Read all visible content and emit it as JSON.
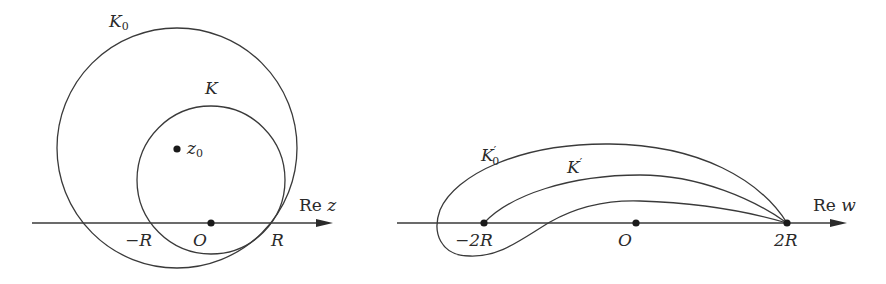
{
  "figure": {
    "left_panel": {
      "name": "z-plane",
      "axis_label": {
        "prefix": "Re",
        "var": "z"
      },
      "curves": [
        {
          "id": "K0",
          "label": "K",
          "subscript": "0",
          "type": "circle",
          "cx": 177,
          "cy": 148,
          "r": 120
        },
        {
          "id": "K",
          "label": "K",
          "subscript": "",
          "type": "circle",
          "cx": 211,
          "cy": 179,
          "r": 74
        }
      ],
      "points": [
        {
          "id": "z0",
          "label": "z",
          "subscript": "0",
          "x": 177,
          "y": 149
        },
        {
          "id": "origin",
          "label": "O",
          "x": 211,
          "y": 223
        }
      ],
      "tick_labels": [
        {
          "id": "minus-R",
          "text": "−R",
          "x": 133,
          "y": 232
        },
        {
          "id": "O",
          "text": "O",
          "x": 201,
          "y": 232
        },
        {
          "id": "R",
          "text": "R",
          "x": 270,
          "y": 232
        }
      ]
    },
    "right_panel": {
      "name": "w-plane",
      "axis_label": {
        "prefix": "Re",
        "var": "w"
      },
      "curves": [
        {
          "id": "K0prime",
          "label": "K",
          "subscript": "0",
          "prime": "′"
        },
        {
          "id": "Kprime",
          "label": "K",
          "subscript": "",
          "prime": "′"
        },
        {
          "id": "inner",
          "label": "",
          "subscript": "",
          "prime": ""
        }
      ],
      "points": [
        {
          "id": "minus-2R",
          "label": "−2R",
          "x": 484,
          "y": 223
        },
        {
          "id": "origin",
          "label": "O",
          "x": 636,
          "y": 223
        },
        {
          "id": "2R",
          "label": "2R",
          "x": 787,
          "y": 223
        }
      ]
    },
    "labels": {
      "K0_main": "K",
      "K0_sub": "0",
      "K_main": "K",
      "z0_main": "z",
      "z0_sub": "0",
      "minus_R": "−R",
      "O_left": "O",
      "R": "R",
      "Re_z_prefix": "Re",
      "Re_z_var": "z",
      "K0p_main": "K",
      "K0p_prime": "′",
      "K0p_sub": "0",
      "Kp_main": "K",
      "Kp_prime": "′",
      "minus_2R": "−2R",
      "O_right": "O",
      "two_R": "2R",
      "Re_w_prefix": "Re",
      "Re_w_var": "w"
    }
  }
}
